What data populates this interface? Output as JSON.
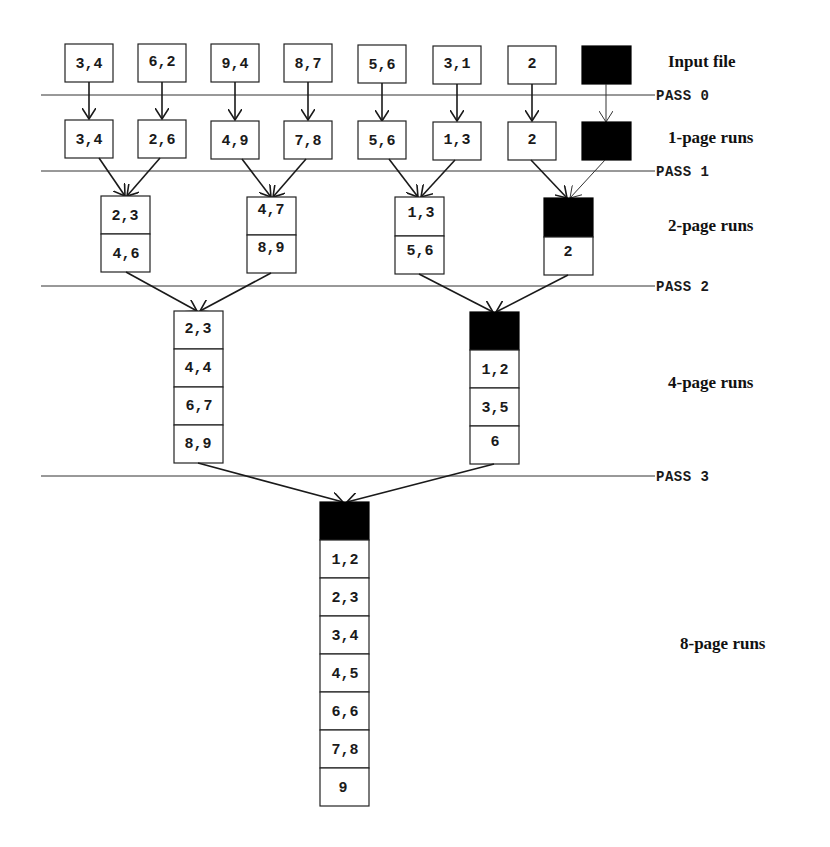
{
  "diagram": {
    "stage_labels": {
      "input": "Input file",
      "runs1": "1-page runs",
      "runs2": "2-page runs",
      "runs4": "4-page runs",
      "runs8": "8-page runs"
    },
    "pass_labels": {
      "p0": "PASS 0",
      "p1": "PASS 1",
      "p2": "PASS 2",
      "p3": "PASS 3"
    },
    "input_file": [
      "3,4",
      "6,2",
      "9,4",
      "8,7",
      "5,6",
      "3,1",
      "2",
      ""
    ],
    "runs1": [
      "3,4",
      "2,6",
      "4,9",
      "7,8",
      "5,6",
      "1,3",
      "2",
      ""
    ],
    "runs2": [
      [
        "2,3",
        "4,6"
      ],
      [
        "4,7",
        "8,9"
      ],
      [
        "1,3",
        "5,6"
      ],
      [
        "",
        "2"
      ]
    ],
    "runs4": [
      [
        "2,3",
        "4,4",
        "6,7",
        "8,9"
      ],
      [
        "",
        "1,2",
        "3,5",
        "6"
      ]
    ],
    "runs8": [
      "",
      "1,2",
      "2,3",
      "3,4",
      "4,5",
      "6,6",
      "7,8",
      "9"
    ],
    "colors": {
      "stroke": "#222222",
      "filled_page": "#000000",
      "background": "#ffffff"
    }
  }
}
